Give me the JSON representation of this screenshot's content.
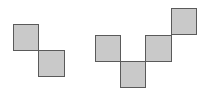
{
  "diagram": {
    "square_size": 26,
    "colors": {
      "fill": "#c9c9c9",
      "border": "#5a5a5a",
      "background": "#ffffff"
    },
    "shapes": [
      {
        "name": "diagonal-domino",
        "squares": [
          {
            "x": 13,
            "y": 24
          },
          {
            "x": 38,
            "y": 50
          }
        ]
      },
      {
        "name": "zigzag-tetromino",
        "squares": [
          {
            "x": 95,
            "y": 35
          },
          {
            "x": 120,
            "y": 61
          },
          {
            "x": 145,
            "y": 35
          },
          {
            "x": 171,
            "y": 8
          }
        ]
      }
    ]
  }
}
